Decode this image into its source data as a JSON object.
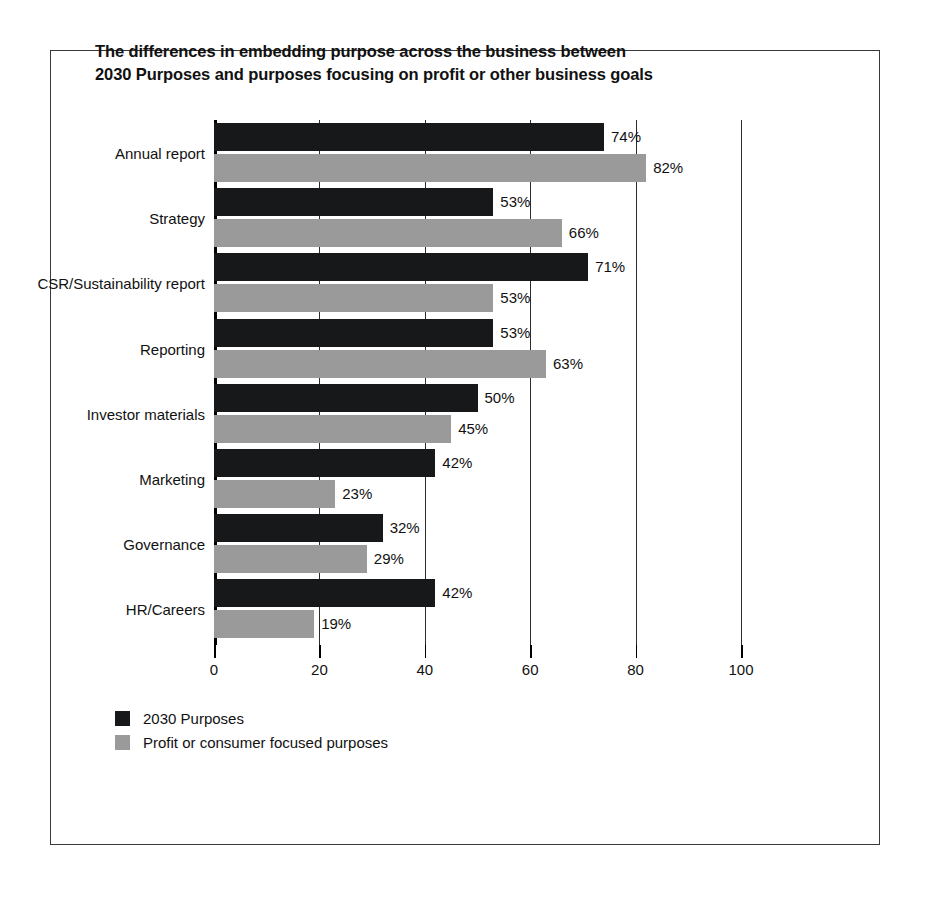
{
  "chart_data": {
    "type": "bar",
    "orientation": "horizontal",
    "title": "The differences in embedding purpose across the business between 2030 Purposes and purposes focusing on profit or other business goals",
    "title_lines": [
      "The differences in embedding purpose across the business between",
      "2030 Purposes and purposes focusing on profit or other business goals"
    ],
    "categories": [
      "Annual report",
      "Strategy",
      "CSR/Sustainability report",
      "Reporting",
      "Investor materials",
      "Marketing",
      "Governance",
      "HR/Careers"
    ],
    "series": [
      {
        "name": "2030 Purposes",
        "color": "#17181a",
        "values": [
          74,
          53,
          71,
          53,
          50,
          42,
          32,
          42
        ],
        "labels": [
          "74%",
          "53%",
          "71%",
          "53%",
          "50%",
          "42%",
          "32%",
          "42%"
        ]
      },
      {
        "name": "Profit or consumer focused purposes",
        "color": "#9a9a9a",
        "values": [
          82,
          66,
          53,
          63,
          45,
          23,
          29,
          19
        ],
        "labels": [
          "82%",
          "66%",
          "53%",
          "63%",
          "45%",
          "23%",
          "29%",
          "19%"
        ]
      }
    ],
    "xlabel": "",
    "ylabel": "",
    "xlim": [
      0,
      100
    ],
    "xticks": [
      0,
      20,
      40,
      60,
      80,
      100
    ],
    "xtick_labels": [
      "0",
      "20",
      "40",
      "60",
      "80",
      "100"
    ],
    "grid": true,
    "grid_axis": "x",
    "legend_position": "bottom-left",
    "value_label_suffix": "%"
  },
  "legend": {
    "items": [
      {
        "label": "2030 Purposes",
        "color": "#17181a"
      },
      {
        "label": "Profit or consumer focused purposes",
        "color": "#9a9a9a"
      }
    ]
  },
  "colors": {
    "series_a": "#17181a",
    "series_b": "#9a9a9a",
    "axis": "#000000",
    "gridline": "#2b2b2b",
    "frame": "#3a3a3a",
    "background": "#ffffff",
    "text": "#111111"
  }
}
